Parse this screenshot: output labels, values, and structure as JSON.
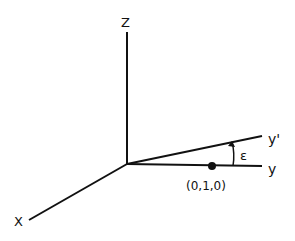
{
  "diagram": {
    "type": "3d-coordinate-axes",
    "origin": {
      "x": 127,
      "y": 164
    },
    "axes": {
      "z": {
        "label": "Z",
        "end": {
          "x": 127,
          "y": 32
        }
      },
      "x": {
        "label": "X",
        "end": {
          "x": 28,
          "y": 220
        }
      },
      "y": {
        "label": "y",
        "end": {
          "x": 263,
          "y": 166
        }
      },
      "y_prime": {
        "label": "y'",
        "end": {
          "x": 263,
          "y": 136
        }
      }
    },
    "point": {
      "label": "(0,1,0)",
      "x": 212,
      "y": 166
    },
    "angle": {
      "label": "ε",
      "between": [
        "y",
        "y'"
      ]
    },
    "colors": {
      "line": "#111111",
      "background": "#ffffff"
    }
  }
}
